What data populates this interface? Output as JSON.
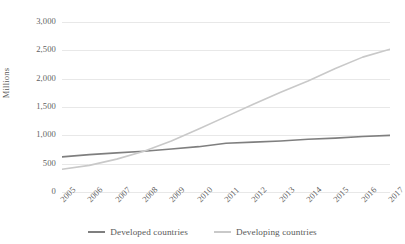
{
  "chart_data": {
    "type": "line",
    "title": "",
    "xlabel": "",
    "ylabel": "Millions",
    "ylim": [
      0,
      3000
    ],
    "yticks": [
      "0",
      "500",
      "1,000",
      "1,500",
      "2,000",
      "2,500",
      "3,000"
    ],
    "ytick_values": [
      0,
      500,
      1000,
      1500,
      2000,
      2500,
      3000
    ],
    "grid": true,
    "legend_position": "bottom",
    "categories": [
      "2005",
      "2006",
      "2007",
      "2008",
      "2009",
      "2010",
      "2011",
      "2012",
      "2013",
      "2014",
      "2015",
      "2016",
      "2017"
    ],
    "series": [
      {
        "name": "Developed countries",
        "color": "#7f7f7f",
        "values": [
          620,
          660,
          690,
          720,
          760,
          800,
          860,
          880,
          900,
          930,
          950,
          980,
          1000
        ]
      },
      {
        "name": "Developing countries",
        "color": "#c9c9c9",
        "values": [
          400,
          470,
          580,
          720,
          900,
          1110,
          1330,
          1550,
          1760,
          1960,
          2180,
          2380,
          2520
        ]
      }
    ]
  },
  "axis": {
    "y_title": "Millions"
  },
  "legend": {
    "items": [
      {
        "label": "Developed countries",
        "color": "#7f7f7f"
      },
      {
        "label": "Developing countries",
        "color": "#c9c9c9"
      }
    ]
  },
  "colors": {
    "gridline": "#e8e8e8",
    "text": "#595959",
    "background": "#ffffff"
  }
}
